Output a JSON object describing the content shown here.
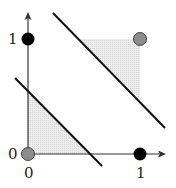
{
  "diagram": {
    "axes": {
      "x_tick_labels": [
        "0",
        "1"
      ],
      "y_tick_labels": [
        "0",
        "1"
      ]
    },
    "points": [
      {
        "coord": "(0,0)",
        "class": "gray",
        "color": "#8c8c8c"
      },
      {
        "coord": "(1,1)",
        "class": "gray",
        "color": "#8c8c8c"
      },
      {
        "coord": "(0,1)",
        "class": "black",
        "color": "#000000"
      },
      {
        "coord": "(1,0)",
        "class": "black",
        "color": "#000000"
      }
    ],
    "decision_lines": 2,
    "shaded_color": "#e6e6e6"
  }
}
